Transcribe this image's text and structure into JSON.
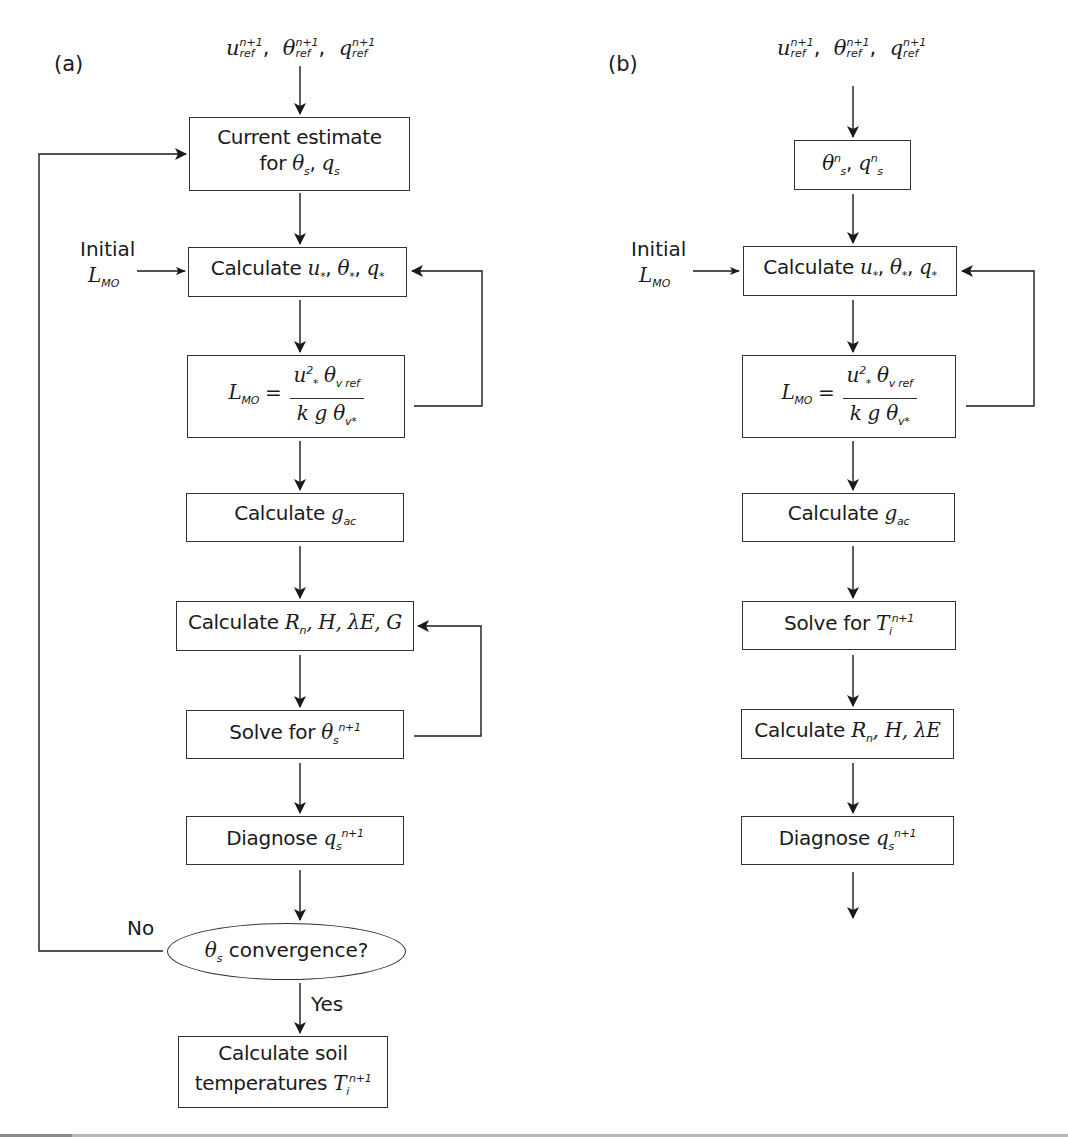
{
  "panel_a": {
    "label": "(a)",
    "inputs": {
      "u": "u",
      "u_sup": "n+1",
      "u_sub": "ref",
      "theta": "θ",
      "theta_sup": "n+1",
      "theta_sub": "ref",
      "q": "q",
      "q_sup": "n+1",
      "q_sub": "ref",
      "sep": ","
    },
    "current_estimate": {
      "line1": "Current estimate",
      "line2_prefix": "for ",
      "theta": "θ",
      "theta_sub": "s",
      "sep": ", ",
      "q": "q",
      "q_sub": "s"
    },
    "initial_lmo": {
      "line1": "Initial",
      "L": "L",
      "L_sub": "MO"
    },
    "calc_stars": {
      "prefix": "Calculate ",
      "u": "u",
      "theta": "θ",
      "q": "q",
      "star": "*",
      "sep": ", "
    },
    "lmo_formula": {
      "L": "L",
      "L_sub": "MO",
      "eq": " = ",
      "num_u": "u",
      "num_u_sup": "2",
      "num_u_sub": "*",
      "num_theta": "θ",
      "num_theta_sub": "v ref",
      "den_k": "k",
      "den_g": "g",
      "den_theta": "θ",
      "den_theta_sub": "v*"
    },
    "calc_gac": {
      "prefix": "Calculate ",
      "g": "g",
      "g_sub": "ac"
    },
    "calc_fluxes": {
      "prefix": "Calculate ",
      "R": "R",
      "R_sub": "n",
      "rest": ", H, λE, G"
    },
    "solve_theta": {
      "prefix": "Solve for ",
      "theta": "θ",
      "theta_sub": "s",
      "theta_sup": "n+1"
    },
    "diagnose_q": {
      "prefix": "Diagnose ",
      "q": "q",
      "q_sub": "s",
      "q_sup": "n+1"
    },
    "convergence": {
      "theta": "θ",
      "theta_sub": "s",
      "text": " convergence?"
    },
    "no_label": "No",
    "yes_label": "Yes",
    "soil_temps": {
      "line1": "Calculate soil",
      "line2_prefix": "temperatures ",
      "T": "T",
      "T_sub": "i",
      "T_sup": "n+1"
    }
  },
  "panel_b": {
    "label": "(b)",
    "inputs": {
      "u": "u",
      "u_sup": "n+1",
      "u_sub": "ref",
      "theta": "θ",
      "theta_sup": "n+1",
      "theta_sub": "ref",
      "q": "q",
      "q_sup": "n+1",
      "q_sub": "ref",
      "sep": ","
    },
    "state": {
      "theta": "θ",
      "theta_sub": "s",
      "theta_sup": "n",
      "sep": ", ",
      "q": "q",
      "q_sub": "s",
      "q_sup": "n"
    },
    "initial_lmo": {
      "line1": "Initial",
      "L": "L",
      "L_sub": "MO"
    },
    "calc_stars": {
      "prefix": "Calculate ",
      "u": "u",
      "theta": "θ",
      "q": "q",
      "star": "*",
      "sep": ", "
    },
    "lmo_formula": {
      "L": "L",
      "L_sub": "MO",
      "eq": " = ",
      "num_u": "u",
      "num_u_sup": "2",
      "num_u_sub": "*",
      "num_theta": "θ",
      "num_theta_sub": "v ref",
      "den_k": "k",
      "den_g": "g",
      "den_theta": "θ",
      "den_theta_sub": "v*"
    },
    "calc_gac": {
      "prefix": "Calculate ",
      "g": "g",
      "g_sub": "ac"
    },
    "solve_T": {
      "prefix": "Solve for ",
      "T": "T",
      "T_sub": "i",
      "T_sup": "n+1"
    },
    "calc_fluxes": {
      "prefix": "Calculate ",
      "R": "R",
      "R_sub": "n",
      "rest": ", H, λE"
    },
    "diagnose_q": {
      "prefix": "Diagnose ",
      "q": "q",
      "q_sub": "s",
      "q_sup": "n+1"
    }
  },
  "colors": {
    "line": "#1a1a1a",
    "box_border": "#333333",
    "background": "#ffffff",
    "bottom_bar": "#b9b9b9"
  }
}
